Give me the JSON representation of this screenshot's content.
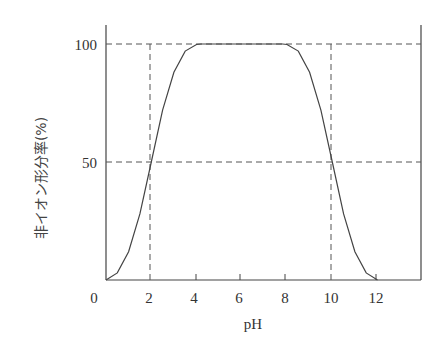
{
  "chart_data": {
    "type": "line",
    "title": "",
    "xlabel": "pH",
    "ylabel": "非イオン形分率(%)",
    "xlim": [
      0,
      14
    ],
    "ylim": [
      0,
      100
    ],
    "x_ticks": [
      "0",
      "2",
      "4",
      "6",
      "8",
      "10",
      "12"
    ],
    "y_ticks": [
      "50",
      "100"
    ],
    "grid": false,
    "reference_lines": {
      "vertical_dashed_x": [
        2,
        10
      ],
      "horizontal_dashed_y": [
        50,
        100
      ]
    },
    "series": [
      {
        "name": "非イオン形分率",
        "x": [
          0,
          0.5,
          1,
          1.5,
          2,
          2.5,
          3,
          3.5,
          4,
          4.2,
          6,
          7.8,
          8,
          8.5,
          9,
          9.5,
          10,
          10.5,
          11,
          11.5,
          12
        ],
        "y": [
          0,
          3,
          12,
          28,
          50,
          72,
          88,
          97,
          99.8,
          100,
          100,
          100,
          99.8,
          97,
          88,
          72,
          50,
          28,
          12,
          3,
          0
        ]
      }
    ]
  }
}
